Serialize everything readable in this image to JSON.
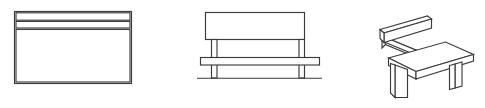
{
  "figure": {
    "background_color": "#ffffff",
    "stroke_color": "#3b3b3b",
    "line_width": 1.15,
    "canvas": {
      "width": 485,
      "height": 108
    },
    "view_count": 3
  },
  "views": [
    {
      "id": "view-elevation-panel",
      "label": "Bench back panel elevation",
      "type": "orthographic-elevation",
      "bounds": {
        "x": 14,
        "y": 11,
        "width": 118,
        "height": 73
      },
      "parts": [
        {
          "name": "outer-panel",
          "label": "Outer panel outline",
          "shape": "rect",
          "x": 14,
          "y": 11,
          "width": 118,
          "height": 73
        },
        {
          "name": "top-slat",
          "label": "Top slat band",
          "shape": "rect",
          "x": 15,
          "y": 12,
          "width": 116,
          "height": 8
        },
        {
          "name": "second-slat",
          "label": "Second slat band",
          "shape": "rect",
          "x": 15,
          "y": 21,
          "width": 116,
          "height": 7
        },
        {
          "name": "lower-body-panel",
          "label": "Lower body panel",
          "shape": "rect",
          "x": 15,
          "y": 29,
          "width": 116,
          "height": 54
        }
      ]
    },
    {
      "id": "view-front-elevation",
      "label": "Bench front elevation",
      "type": "orthographic-front",
      "bounds": {
        "x": 197,
        "y": 12,
        "width": 125,
        "height": 72
      },
      "parts": [
        {
          "name": "backrest-plank",
          "label": "Backrest plank",
          "shape": "rect",
          "x": 205,
          "y": 12,
          "width": 100,
          "height": 28
        },
        {
          "name": "left-upright-post",
          "label": "Left upright post",
          "shape": "rect",
          "x": 211,
          "y": 40,
          "width": 6,
          "height": 38
        },
        {
          "name": "right-upright-post",
          "label": "Right upright post",
          "shape": "rect",
          "x": 299,
          "y": 40,
          "width": 6,
          "height": 38
        },
        {
          "name": "seat-plank",
          "label": "Seat plank",
          "shape": "rect",
          "x": 200,
          "y": 57,
          "width": 120,
          "height": 8
        },
        {
          "name": "ground-line",
          "label": "Ground line",
          "shape": "line",
          "x1": 197,
          "y1": 78,
          "x2": 322,
          "y2": 78
        }
      ]
    },
    {
      "id": "view-perspective",
      "label": "Bench perspective view",
      "type": "perspective-3d",
      "bounds": {
        "x": 376,
        "y": 14,
        "width": 98,
        "height": 86
      },
      "parts": [
        {
          "name": "backrest-slab",
          "label": "Angled backrest slab"
        },
        {
          "name": "back-support-arm",
          "label": "Back support arm"
        },
        {
          "name": "seat-slab",
          "label": "Angled seat slab"
        },
        {
          "name": "front-left-leg",
          "label": "Front left leg"
        },
        {
          "name": "rear-right-leg",
          "label": "Rear right leg"
        }
      ]
    }
  ]
}
